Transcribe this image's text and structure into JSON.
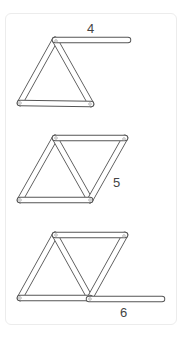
{
  "figure": {
    "steps": [
      {
        "label": "4",
        "sticks": 4
      },
      {
        "label": "5",
        "sticks": 5
      },
      {
        "label": "6",
        "sticks": 6
      }
    ]
  }
}
